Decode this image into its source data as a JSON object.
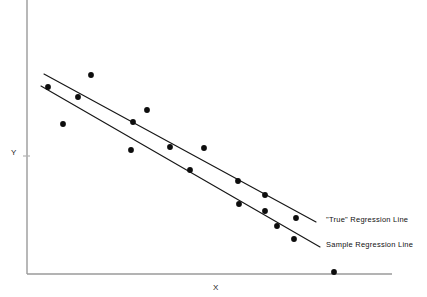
{
  "chart_data": {
    "type": "scatter",
    "title": "",
    "subtitle": "",
    "xlabel": "X",
    "ylabel": "Y",
    "grid": false,
    "legend_position": "inline-right",
    "axes": {
      "x_axis": {
        "start_px": 27,
        "end_px": 392,
        "y_px": 274,
        "ticks": [],
        "tick_labels": []
      },
      "y_axis": {
        "top_px": 0,
        "bottom_px": 274,
        "x_px": 27,
        "ticks": [
          156
        ],
        "tick_labels": []
      },
      "xlim": [
        0,
        1
      ],
      "ylim": [
        0,
        1
      ]
    },
    "points": [
      {
        "x": 48,
        "y": 87
      },
      {
        "x": 78,
        "y": 97
      },
      {
        "x": 91,
        "y": 75
      },
      {
        "x": 63,
        "y": 124
      },
      {
        "x": 133,
        "y": 122
      },
      {
        "x": 147,
        "y": 110
      },
      {
        "x": 131,
        "y": 150
      },
      {
        "x": 170,
        "y": 147
      },
      {
        "x": 204,
        "y": 148
      },
      {
        "x": 190,
        "y": 170
      },
      {
        "x": 238,
        "y": 181
      },
      {
        "x": 265,
        "y": 195
      },
      {
        "x": 239,
        "y": 204
      },
      {
        "x": 265,
        "y": 211
      },
      {
        "x": 277,
        "y": 226
      },
      {
        "x": 296,
        "y": 218
      },
      {
        "x": 294,
        "y": 239
      },
      {
        "x": 334,
        "y": 272
      }
    ],
    "series": [
      {
        "name": "“True” Regression Line",
        "type": "line",
        "x1": 44,
        "y1": 74,
        "x2": 316,
        "y2": 222
      },
      {
        "name": "Sample Regression Line",
        "type": "line",
        "x1": 41,
        "y1": 86,
        "x2": 320,
        "y2": 247
      }
    ],
    "annotations": [
      {
        "text": "\"True\" Regression Line",
        "x": 326,
        "y": 219
      },
      {
        "text": "Sample Regression Line",
        "x": 326,
        "y": 244
      }
    ],
    "colors": {
      "background": "#ffffff",
      "axis": "#9a9a9a",
      "line": "#161616",
      "point": "#0d0d0d",
      "text": "#111111"
    }
  },
  "labels": {
    "y_axis": "Y",
    "x_axis": "X",
    "true_regression_line": "\"True\" Regression Line",
    "sample_regression_line": "Sample Regression Line"
  }
}
